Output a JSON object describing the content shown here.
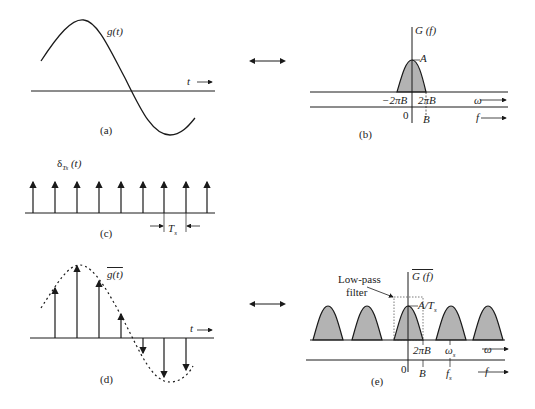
{
  "panels": {
    "a": {
      "caption": "(a)",
      "signal_label": "g(t)",
      "axis_label": "t"
    },
    "b": {
      "caption": "(b)",
      "spectrum_label": "G (f)",
      "peak_label": "A",
      "neg_edge": "−2πB",
      "pos_edge": "2πB",
      "omega_axis": "ω",
      "f_axis": "f",
      "origin": "0",
      "f_edge": "B"
    },
    "c": {
      "caption": "(c)",
      "impulse_label": "δ",
      "impulse_sub": "Ts",
      "impulse_arg": "(t)",
      "period_label": "T",
      "period_sub": "s"
    },
    "d": {
      "caption": "(d)",
      "sampled_label": "g(t)",
      "axis_label": "t"
    },
    "e": {
      "caption": "(e)",
      "spectrum_label": "G (f)",
      "filter_label_1": "Low-pass",
      "filter_label_2": "filter",
      "peak_label": "A/T",
      "peak_sub": "s",
      "edge_label": "2πB",
      "omega_s": "ω",
      "omega_s_sub": "s",
      "omega_axis": "ω",
      "origin": "0",
      "f_edge": "B",
      "f_s": "f",
      "f_s_sub": "s",
      "f_axis": "f"
    }
  },
  "colors": {
    "line": "#1a1a1a",
    "fill": "#b3b3b3"
  }
}
